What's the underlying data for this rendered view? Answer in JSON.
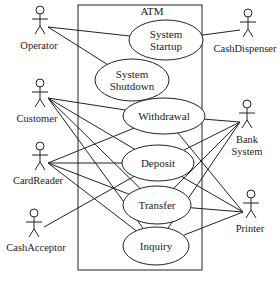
{
  "diagram": {
    "type": "uml-use-case",
    "system": {
      "label": "ATM",
      "box": {
        "x": 78,
        "y": 5,
        "w": 124,
        "h": 265
      }
    },
    "use_cases": [
      {
        "id": "startup",
        "lines": [
          "System",
          "Startup"
        ],
        "cx": 166,
        "cy": 40,
        "rx": 37,
        "ry": 20
      },
      {
        "id": "shutdown",
        "lines": [
          "System",
          "Shutdown"
        ],
        "cx": 132,
        "cy": 80,
        "rx": 37,
        "ry": 21
      },
      {
        "id": "withdrawal",
        "lines": [
          "Withdrawal"
        ],
        "cx": 164,
        "cy": 116,
        "rx": 41,
        "ry": 18
      },
      {
        "id": "deposit",
        "lines": [
          "Deposit"
        ],
        "cx": 158,
        "cy": 163,
        "rx": 36,
        "ry": 18
      },
      {
        "id": "transfer",
        "lines": [
          "Transfer"
        ],
        "cx": 157,
        "cy": 205,
        "rx": 34,
        "ry": 19
      },
      {
        "id": "inquiry",
        "lines": [
          "Inquiry"
        ],
        "cx": 156,
        "cy": 246,
        "rx": 33,
        "ry": 19
      }
    ],
    "actors": [
      {
        "id": "operator",
        "label": "Operator",
        "x": 40,
        "y": 10,
        "labelX": 39,
        "labelY": 49,
        "anchor": [
          48,
          27
        ]
      },
      {
        "id": "customer",
        "label": "Customer",
        "x": 40,
        "y": 83,
        "labelX": 37,
        "labelY": 122,
        "anchor": [
          48,
          98
        ]
      },
      {
        "id": "cardreader",
        "label": "CardReader",
        "x": 40,
        "y": 146,
        "labelX": 38,
        "labelY": 184,
        "anchor": [
          48,
          163
        ]
      },
      {
        "id": "cashacceptor",
        "label": "CashAcceptor",
        "x": 34,
        "y": 213,
        "labelX": 36,
        "labelY": 251,
        "anchor": [
          44,
          227
        ]
      },
      {
        "id": "cashdispenser",
        "label": "CashDispenser",
        "x": 248,
        "y": 13,
        "labelX": 245,
        "labelY": 52,
        "anchor": [
          240,
          30
        ]
      },
      {
        "id": "banksystem",
        "label": [
          "Bank",
          "System"
        ],
        "x": 247,
        "y": 104,
        "labelX": 247,
        "labelY": 143,
        "anchor": [
          240,
          122
        ]
      },
      {
        "id": "printer",
        "label": "Printer",
        "x": 251,
        "y": 194,
        "labelX": 250,
        "labelY": 232,
        "anchor": [
          243,
          212
        ]
      }
    ],
    "associations": [
      [
        "operator",
        "startup"
      ],
      [
        "operator",
        "shutdown"
      ],
      [
        "cashdispenser",
        "startup"
      ],
      [
        "customer",
        "withdrawal"
      ],
      [
        "customer",
        "deposit"
      ],
      [
        "customer",
        "transfer"
      ],
      [
        "customer",
        "inquiry"
      ],
      [
        "cardreader",
        "withdrawal"
      ],
      [
        "cardreader",
        "deposit"
      ],
      [
        "cardreader",
        "transfer"
      ],
      [
        "cardreader",
        "inquiry"
      ],
      [
        "cashacceptor",
        "deposit"
      ],
      [
        "banksystem",
        "withdrawal"
      ],
      [
        "banksystem",
        "deposit"
      ],
      [
        "banksystem",
        "transfer"
      ],
      [
        "banksystem",
        "inquiry"
      ],
      [
        "printer",
        "withdrawal"
      ],
      [
        "printer",
        "deposit"
      ],
      [
        "printer",
        "transfer"
      ],
      [
        "printer",
        "inquiry"
      ]
    ]
  }
}
